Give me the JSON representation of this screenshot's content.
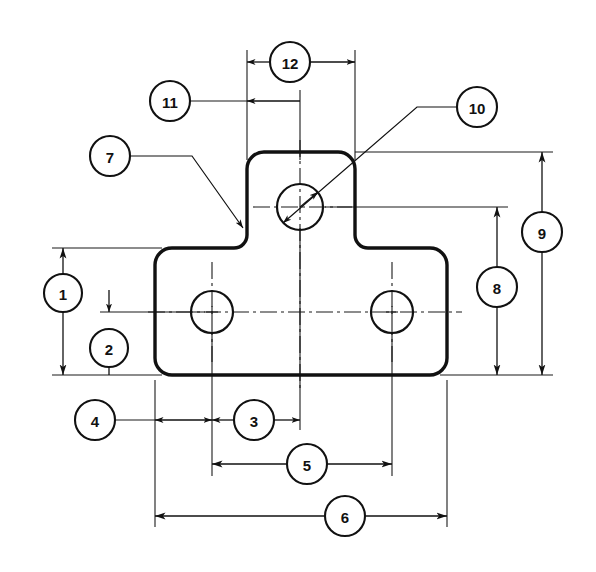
{
  "drawing": {
    "title": "Balloon-numbered dimension drawing of a T-shaped flat bracket plate",
    "background_color": "#ffffff",
    "line_color": "#111111",
    "width": 596,
    "height": 572,
    "part": {
      "name": "t-shaped-bracket-plate",
      "description": "Flat T-shaped plate with rounded corners, one hole in the upper flange and two holes in the lower base",
      "corner_radius": 17,
      "inner_fillet_radius": 13,
      "base": {
        "left": 155,
        "right": 447,
        "top": 248,
        "bottom": 375
      },
      "flange": {
        "left": 247,
        "right": 355,
        "top": 152,
        "bottom": 248
      }
    },
    "holes": [
      {
        "name": "upper-flange-hole",
        "cx": 300,
        "cy": 207,
        "r": 23
      },
      {
        "name": "lower-left-hole",
        "cx": 212,
        "cy": 312,
        "r": 21
      },
      {
        "name": "lower-right-hole",
        "cx": 392,
        "cy": 312,
        "r": 21
      }
    ],
    "balloons": [
      {
        "number": "1",
        "cx": 63,
        "cy": 293,
        "r": 19,
        "kind": "vertical-dimension",
        "describes": "overall height of lower base block"
      },
      {
        "number": "2",
        "cx": 109,
        "cy": 348,
        "r": 19,
        "kind": "vertical-dimension",
        "describes": "distance from hole centerline to bottom edge"
      },
      {
        "number": "3",
        "cx": 254,
        "cy": 420,
        "r": 20,
        "kind": "horizontal-dimension",
        "describes": "distance from lower-left hole centerline to vertical part centerline"
      },
      {
        "number": "4",
        "cx": 95,
        "cy": 420,
        "r": 20,
        "kind": "horizontal-dimension",
        "describes": "distance from left edge to lower-left hole centerline"
      },
      {
        "number": "5",
        "cx": 307,
        "cy": 464,
        "r": 20,
        "kind": "horizontal-dimension",
        "describes": "center-to-center spacing of the two lower holes"
      },
      {
        "number": "6",
        "cx": 345,
        "cy": 516,
        "r": 20,
        "kind": "horizontal-dimension",
        "describes": "overall width of the base"
      },
      {
        "number": "7",
        "cx": 110,
        "cy": 156,
        "r": 20,
        "kind": "leader-callout",
        "describes": "inner fillet radius at flange-to-base junction"
      },
      {
        "number": "8",
        "cx": 497,
        "cy": 287,
        "r": 20,
        "kind": "vertical-dimension",
        "describes": "height from bottom edge up to upper hole centerline"
      },
      {
        "number": "9",
        "cx": 542,
        "cy": 232,
        "r": 20,
        "kind": "vertical-dimension",
        "describes": "overall height of the part"
      },
      {
        "number": "10",
        "cx": 477,
        "cy": 107,
        "r": 20,
        "kind": "leader-callout",
        "describes": "diameter of the upper flange hole"
      },
      {
        "number": "11",
        "cx": 170,
        "cy": 101,
        "r": 20,
        "kind": "horizontal-dimension",
        "describes": "distance from flange left edge to vertical part centerline"
      },
      {
        "number": "12",
        "cx": 290,
        "cy": 62,
        "r": 20,
        "kind": "horizontal-dimension",
        "describes": "overall width of the upper flange"
      }
    ],
    "dimension_lines": [
      {
        "name": "dim-1-overall-base-height",
        "orientation": "vertical",
        "x": 63,
        "from": 248,
        "to": 375
      },
      {
        "name": "dim-2-centerline-to-bottom",
        "orientation": "vertical",
        "x": 109,
        "from": 312,
        "to": 375
      },
      {
        "name": "dim-3-hole-to-centerline",
        "orientation": "horizontal",
        "y": 420,
        "from": 212,
        "to": 300
      },
      {
        "name": "dim-4-edge-to-hole",
        "orientation": "horizontal",
        "y": 420,
        "from": 155,
        "to": 212
      },
      {
        "name": "dim-5-hole-spacing",
        "orientation": "horizontal",
        "y": 464,
        "from": 212,
        "to": 392
      },
      {
        "name": "dim-6-overall-width",
        "orientation": "horizontal",
        "y": 516,
        "from": 155,
        "to": 447
      },
      {
        "name": "dim-8-bottom-to-upper-hole",
        "orientation": "vertical",
        "x": 497,
        "from": 207,
        "to": 375
      },
      {
        "name": "dim-9-overall-height",
        "orientation": "vertical",
        "x": 542,
        "from": 152,
        "to": 375
      },
      {
        "name": "dim-11-flange-edge-to-centerline",
        "orientation": "horizontal",
        "y": 101,
        "from": 247,
        "to": 300
      },
      {
        "name": "dim-12-flange-width",
        "orientation": "horizontal",
        "y": 62,
        "from": 247,
        "to": 355
      }
    ]
  }
}
